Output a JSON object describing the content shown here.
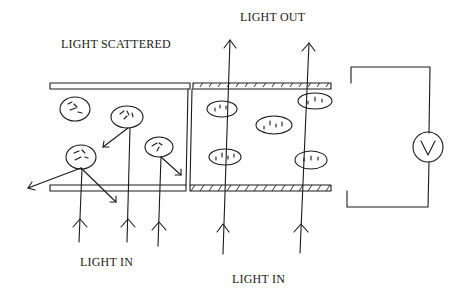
{
  "diagram": {
    "type": "hand-drawn schematic",
    "labels": {
      "light_scattered": "LIGHT SCATTERED",
      "light_out": "LIGHT OUT",
      "light_in_left": "LIGHT IN",
      "light_in_right": "LIGHT IN",
      "voltmeter": "V"
    },
    "regions": [
      {
        "name": "left-region",
        "state": "particles randomly oriented, light scattered",
        "particle_count": 4,
        "incoming_rays": 3
      },
      {
        "name": "right-region",
        "state": "particles aligned by field (hatched electrodes), light transmitted",
        "particle_count": 5,
        "transmitted_rays": 2
      }
    ],
    "colors": {
      "ink": "#1a1a1a",
      "background": "#ffffff"
    }
  }
}
